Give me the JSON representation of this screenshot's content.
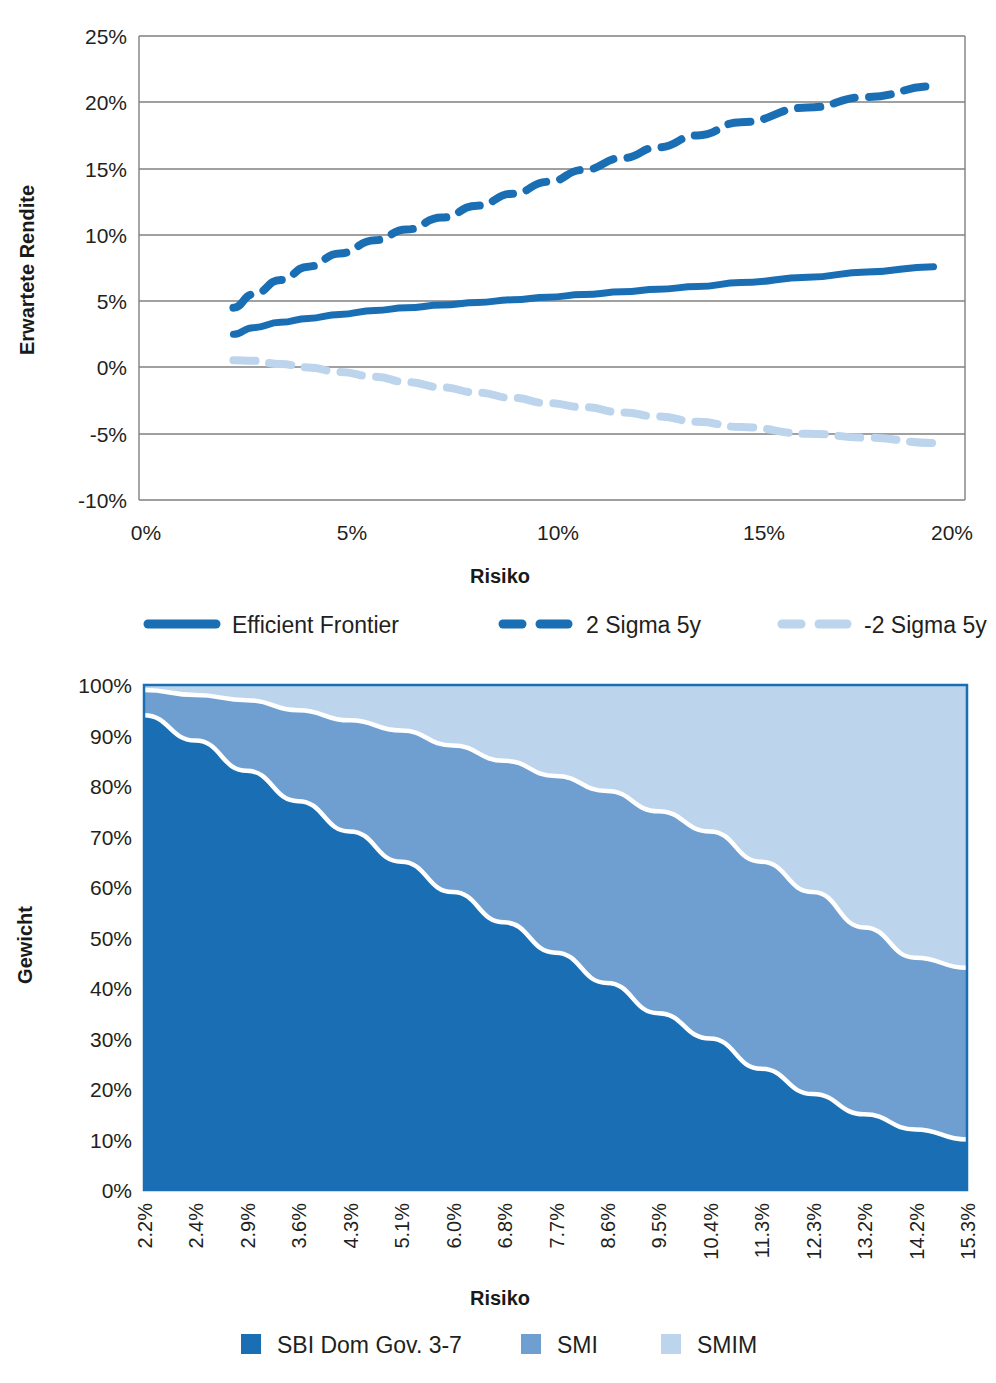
{
  "colors": {
    "dark_blue": "#1a6fb4",
    "mid_blue": "#6e9fd0",
    "light_blue": "#bcd4ec",
    "axis": "#808080",
    "text": "#231f20",
    "plot_border_bottom": "#1a6fb4"
  },
  "chart_data": [
    {
      "type": "line",
      "title": "",
      "xlabel": "Risiko",
      "ylabel": "Erwartete Rendite",
      "xlim": [
        0,
        21
      ],
      "ylim": [
        -10,
        25
      ],
      "xticks": [
        "0%",
        "5%",
        "10%",
        "15%",
        "20%"
      ],
      "xtick_values": [
        0,
        5,
        10,
        15,
        20
      ],
      "yticks": [
        "-10%",
        "-5%",
        "0%",
        "5%",
        "10%",
        "15%",
        "20%",
        "25%"
      ],
      "ytick_values": [
        -10,
        -5,
        0,
        5,
        10,
        15,
        20,
        25
      ],
      "grid": "horizontal",
      "legend_position": "bottom",
      "x": [
        2.4,
        2.9,
        3.6,
        4.3,
        5.1,
        6.0,
        6.8,
        7.7,
        8.6,
        9.5,
        10.4,
        11.3,
        12.3,
        13.2,
        14.2,
        15.3,
        17.0,
        18.5,
        20.2
      ],
      "series": [
        {
          "name": "Efficient Frontier",
          "style": "solid",
          "color": "#1a6fb4",
          "values": [
            2.5,
            3.0,
            3.4,
            3.7,
            4.0,
            4.3,
            4.5,
            4.7,
            4.9,
            5.1,
            5.3,
            5.5,
            5.7,
            5.9,
            6.1,
            6.4,
            6.8,
            7.2,
            7.6
          ]
        },
        {
          "name": "2 Sigma 5y",
          "style": "dashed",
          "color": "#1a6fb4",
          "values": [
            4.5,
            5.5,
            6.6,
            7.6,
            8.6,
            9.6,
            10.4,
            11.3,
            12.2,
            13.1,
            14.0,
            14.9,
            15.8,
            16.6,
            17.5,
            18.5,
            19.6,
            20.4,
            21.2
          ]
        },
        {
          "name": "-2 Sigma 5y",
          "style": "dashed",
          "color": "#bcd4ec",
          "values": [
            0.55,
            0.5,
            0.25,
            0.0,
            -0.35,
            -0.7,
            -1.1,
            -1.5,
            -1.9,
            -2.3,
            -2.7,
            -3.0,
            -3.4,
            -3.7,
            -4.1,
            -4.5,
            -5.0,
            -5.3,
            -5.7
          ]
        }
      ]
    },
    {
      "type": "area",
      "stacked": true,
      "title": "",
      "xlabel": "Risiko",
      "ylabel": "Gewicht",
      "ylim": [
        0,
        100
      ],
      "yticks": [
        "0%",
        "10%",
        "20%",
        "30%",
        "40%",
        "50%",
        "60%",
        "70%",
        "80%",
        "90%",
        "100%"
      ],
      "ytick_values": [
        0,
        10,
        20,
        30,
        40,
        50,
        60,
        70,
        80,
        90,
        100
      ],
      "grid": "none",
      "legend_position": "bottom",
      "categories": [
        "2.2%",
        "2.4%",
        "2.9%",
        "3.6%",
        "4.3%",
        "5.1%",
        "6.0%",
        "6.8%",
        "7.7%",
        "8.6%",
        "9.5%",
        "10.4%",
        "11.3%",
        "12.3%",
        "13.2%",
        "14.2%",
        "15.3%"
      ],
      "series": [
        {
          "name": "SBI Dom Gov. 3-7",
          "color": "#1a6fb4",
          "values": [
            94,
            89,
            83,
            77,
            71,
            65,
            59,
            53,
            47,
            41,
            35,
            30,
            24,
            19,
            15,
            12,
            10
          ]
        },
        {
          "name": "SMI",
          "color": "#6e9fd0",
          "values": [
            5,
            9,
            14,
            18,
            22,
            26,
            29,
            32,
            35,
            38,
            40,
            41,
            41,
            40,
            37,
            34,
            34
          ]
        },
        {
          "name": "SMIM",
          "color": "#bcd4ec",
          "values": [
            1,
            2,
            3,
            5,
            7,
            9,
            12,
            15,
            18,
            21,
            25,
            29,
            35,
            41,
            48,
            54,
            56
          ]
        }
      ]
    }
  ],
  "frontier": {
    "y_axis_title": "Erwartete Rendite",
    "x_axis_title": "Risiko",
    "y_ticks": [
      "25%",
      "20%",
      "15%",
      "10%",
      "5%",
      "0%",
      "-5%",
      "-10%"
    ],
    "x_ticks": [
      "0%",
      "5%",
      "10%",
      "15%",
      "20%"
    ],
    "legend": [
      {
        "label": "Efficient Frontier",
        "style": "solid",
        "color": "#1a6fb4"
      },
      {
        "label": "2 Sigma 5y",
        "style": "dashed",
        "color": "#1a6fb4"
      },
      {
        "label": "-2 Sigma 5y",
        "style": "dashed",
        "color": "#bcd4ec"
      }
    ]
  },
  "weights": {
    "y_axis_title": "Gewicht",
    "x_axis_title": "Risiko",
    "y_ticks": [
      "100%",
      "90%",
      "80%",
      "70%",
      "60%",
      "50%",
      "40%",
      "30%",
      "20%",
      "10%",
      "0%"
    ],
    "x_ticks": [
      "2.2%",
      "2.4%",
      "2.9%",
      "3.6%",
      "4.3%",
      "5.1%",
      "6.0%",
      "6.8%",
      "7.7%",
      "8.6%",
      "9.5%",
      "10.4%",
      "11.3%",
      "12.3%",
      "13.2%",
      "14.2%",
      "15.3%"
    ],
    "legend": [
      {
        "label": "SBI Dom Gov. 3-7",
        "color": "#1a6fb4"
      },
      {
        "label": "SMI",
        "color": "#6e9fd0"
      },
      {
        "label": "SMIM",
        "color": "#bcd4ec"
      }
    ]
  }
}
